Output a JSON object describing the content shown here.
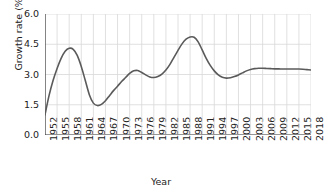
{
  "chart_data": {
    "type": "line",
    "title": "",
    "xlabel": "Year",
    "ylabel": "Growth rate (%)",
    "xlim": [
      1952,
      2018
    ],
    "ylim": [
      0.0,
      6.0
    ],
    "grid": true,
    "legend": "none",
    "line_color": "#5a5a5a",
    "grid_color": "#d8d8d8",
    "axis_color": "#3c3c3c",
    "ytick_labels": [
      "0.0",
      "1.5",
      "3.0",
      "4.5",
      "6.0"
    ],
    "ytick_values": [
      0.0,
      1.5,
      3.0,
      4.5,
      6.0
    ],
    "xtick_labels": [
      "1952",
      "1955",
      "1958",
      "1961",
      "1964",
      "1967",
      "1970",
      "1973",
      "1976",
      "1979",
      "1982",
      "1985",
      "1988",
      "1991",
      "1994",
      "1997",
      "2000",
      "2003",
      "2006",
      "2009",
      "2012",
      "2015",
      "2018"
    ],
    "xtick_values": [
      1952,
      1955,
      1958,
      1961,
      1964,
      1967,
      1970,
      1973,
      1976,
      1979,
      1982,
      1985,
      1988,
      1991,
      1994,
      1997,
      2000,
      2003,
      2006,
      2009,
      2012,
      2015,
      2018
    ],
    "x": [
      1952,
      1953,
      1954,
      1955,
      1956,
      1957,
      1958,
      1959,
      1960,
      1961,
      1962,
      1963,
      1964,
      1965,
      1966,
      1967,
      1968,
      1969,
      1970,
      1971,
      1972,
      1973,
      1974,
      1975,
      1976,
      1977,
      1978,
      1979,
      1980,
      1981,
      1982,
      1983,
      1984,
      1985,
      1986,
      1987,
      1988,
      1989,
      1990,
      1991,
      1992,
      1993,
      1994,
      1995,
      1996,
      1997,
      1998,
      1999,
      2000,
      2001,
      2002,
      2003,
      2004,
      2005,
      2006,
      2007,
      2008,
      2009,
      2010,
      2011,
      2012,
      2013,
      2014,
      2015,
      2016,
      2017,
      2018
    ],
    "values": [
      1.0,
      1.95,
      2.7,
      3.3,
      3.8,
      4.15,
      4.3,
      4.25,
      3.95,
      3.4,
      2.7,
      2.0,
      1.58,
      1.46,
      1.52,
      1.7,
      1.95,
      2.2,
      2.42,
      2.65,
      2.85,
      3.05,
      3.18,
      3.2,
      3.1,
      2.98,
      2.88,
      2.85,
      2.9,
      3.02,
      3.22,
      3.5,
      3.85,
      4.2,
      4.52,
      4.75,
      4.86,
      4.85,
      4.62,
      4.22,
      3.8,
      3.45,
      3.18,
      2.98,
      2.86,
      2.82,
      2.84,
      2.9,
      2.98,
      3.08,
      3.18,
      3.25,
      3.29,
      3.31,
      3.31,
      3.3,
      3.29,
      3.28,
      3.28,
      3.27,
      3.27,
      3.27,
      3.27,
      3.27,
      3.26,
      3.24,
      3.22
    ],
    "series_name": "Growth rate"
  },
  "axis": {
    "y_label": "Growth rate (%)",
    "x_label": "Year"
  }
}
